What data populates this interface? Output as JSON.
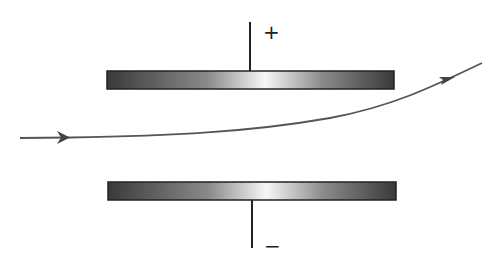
{
  "diagram": {
    "top_plate": {
      "polarity": "+"
    },
    "bottom_plate": {
      "polarity": "−"
    },
    "trajectory": {
      "label": "particle path",
      "color": "#555555"
    },
    "colors": {
      "plate_dark": "#3a3a3a",
      "plate_light": "#f4f4f4",
      "wire": "#222222"
    }
  }
}
